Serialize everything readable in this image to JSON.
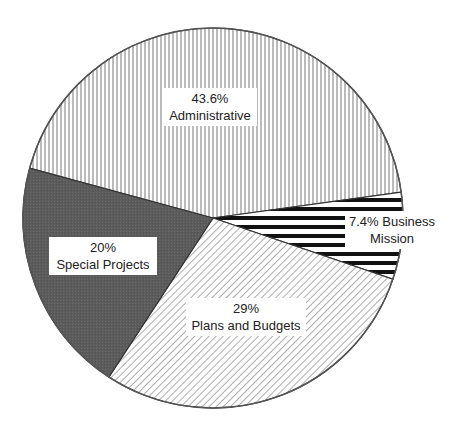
{
  "chart_data": {
    "type": "pie",
    "title": "",
    "start_angle_deg": 195.2,
    "direction": "clockwise",
    "slices": [
      {
        "label": "Administrative",
        "value": 43.6,
        "value_text": "43.6%",
        "pattern": "vertical-lines",
        "color": "#ffffff"
      },
      {
        "label": "Business Mission",
        "value": 7.4,
        "value_text": "7.4%",
        "pattern": "horizontal-thick-black-lines",
        "color": "#ffffff"
      },
      {
        "label": "Plans and Budgets",
        "value": 29,
        "value_text": "29%",
        "pattern": "diagonal-lines",
        "color": "#ffffff"
      },
      {
        "label": "Special Projects",
        "value": 20,
        "value_text": "20%",
        "pattern": "dark-gray-solid",
        "color": "#5e5e5e"
      }
    ]
  },
  "labels": {
    "administrative": {
      "line1": "43.6%",
      "line2": "Administrative"
    },
    "business": {
      "line1": "7.4% Business",
      "line2": "Mission"
    },
    "plans": {
      "line1": "29%",
      "line2": "Plans and Budgets"
    },
    "special": {
      "line1": "20%",
      "line2": "Special Projects"
    }
  }
}
